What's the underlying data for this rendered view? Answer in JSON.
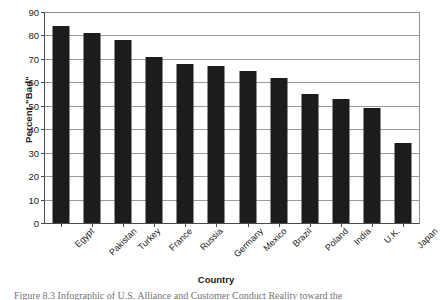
{
  "chart_data": {
    "type": "bar",
    "title": "",
    "xlabel": "Country",
    "ylabel": "Percent \"Bad\"",
    "categories": [
      "Egypt",
      "Pakistan",
      "Turkey",
      "France",
      "Russia",
      "Germany",
      "Mexico",
      "Brazil",
      "Poland",
      "India",
      "U.K.",
      "Japan"
    ],
    "values": [
      84,
      81,
      78,
      71,
      68,
      67,
      65,
      62,
      55,
      53,
      49,
      34
    ],
    "ylim": [
      0,
      90
    ],
    "ytick_step": 10,
    "yticks": [
      0,
      10,
      20,
      30,
      40,
      50,
      60,
      70,
      80,
      90
    ],
    "ytick_labels": [
      "0",
      "10",
      "20",
      "30",
      "40",
      "50",
      "60",
      "70",
      "80",
      "90"
    ],
    "grid": "horizontal",
    "legend": "none",
    "bar_color": "#1c1c1c",
    "axis_color": "#4a4a4a",
    "gridline_color": "#9a9a9a"
  },
  "caption": {
    "text": "Figure 8.3   Infographic of U.S. Alliance and Customer Conduct Reality toward the"
  }
}
